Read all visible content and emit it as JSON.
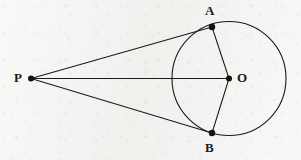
{
  "figure": {
    "kind": "geometry-diagram",
    "width": 301,
    "height": 160,
    "background_color": "#f2f2f0",
    "stroke_color": "#1a1a1a",
    "point_fill_color": "#111111",
    "circle": {
      "name": "circle-O",
      "center_label": "O",
      "cx": 229,
      "cy": 78.5,
      "r": 57,
      "stroke_width": 1.1
    },
    "points": [
      {
        "id": "P",
        "label": "P",
        "x": 31,
        "y": 78.5,
        "dot_r": 3.0,
        "label_x": 14,
        "label_y": 71
      },
      {
        "id": "A",
        "label": "A",
        "x": 212,
        "y": 27,
        "dot_r": 3.2,
        "label_x": 205,
        "label_y": 4
      },
      {
        "id": "B",
        "label": "B",
        "x": 212,
        "y": 133,
        "dot_r": 3.2,
        "label_x": 205,
        "label_y": 141
      },
      {
        "id": "O",
        "label": "O",
        "x": 229,
        "y": 78.5,
        "dot_r": 3.0,
        "label_x": 237,
        "label_y": 71
      }
    ],
    "segments": [
      {
        "id": "PA",
        "from": "P",
        "to": "A",
        "x1": 31,
        "y1": 78.5,
        "x2": 212,
        "y2": 27
      },
      {
        "id": "PB",
        "from": "P",
        "to": "B",
        "x1": 31,
        "y1": 78.5,
        "x2": 212,
        "y2": 133
      },
      {
        "id": "PO",
        "from": "P",
        "to": "O",
        "x1": 31,
        "y1": 78.5,
        "x2": 229,
        "y2": 78.5
      },
      {
        "id": "AO",
        "from": "A",
        "to": "O",
        "x1": 212,
        "y1": 27,
        "x2": 229,
        "y2": 78.5
      },
      {
        "id": "BO",
        "from": "B",
        "to": "O",
        "x1": 212,
        "y1": 133,
        "x2": 229,
        "y2": 78.5
      }
    ],
    "labels": {
      "P": "P",
      "A": "A",
      "B": "B",
      "O": "O"
    }
  }
}
